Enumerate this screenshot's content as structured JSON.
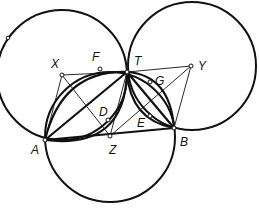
{
  "diagram": {
    "type": "geometry",
    "stroke_color": "#111111",
    "background": "#ffffff",
    "circles": [
      {
        "name": "circle-x",
        "center": "X"
      },
      {
        "name": "circle-y",
        "center": "Y"
      },
      {
        "name": "circle-z",
        "center": "Z"
      }
    ],
    "labels": {
      "X": "X",
      "F": "F",
      "T": "T",
      "G": "G",
      "Y": "Y",
      "D": "D",
      "E": "E",
      "A": "A",
      "Z": "Z",
      "B": "B"
    }
  }
}
